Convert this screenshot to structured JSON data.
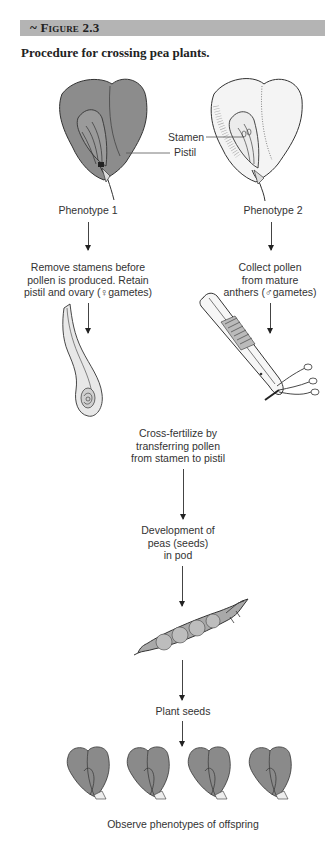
{
  "figure": {
    "number_label": "~ Figure 2.3",
    "caption": "Procedure for crossing pea plants."
  },
  "parents": {
    "left": {
      "label": "Phenotype 1",
      "shade": "#8c8c8c"
    },
    "right": {
      "label": "Phenotype 2",
      "shade": "#f2f2f2"
    },
    "callouts": {
      "stamen": "Stamen",
      "pistil": "Pistil"
    }
  },
  "steps": {
    "left_step": [
      "Remove stamens before",
      "pollen is produced.  Retain",
      "pistil and ovary (♀gametes)"
    ],
    "right_step": [
      "Collect pollen",
      "from mature",
      "anthers (♂gametes)"
    ],
    "cross": [
      "Cross-fertilize by",
      "transferring pollen",
      "from stamen to pistil"
    ],
    "develop": [
      "Development of",
      "peas (seeds)",
      "in pod"
    ],
    "plant": "Plant seeds",
    "observe": "Observe phenotypes of offspring"
  },
  "illustrations": {
    "ovary": "pistil-ovary-drawing",
    "tweezers": "forceps-with-anthers-drawing",
    "pod": "pea-pod-drawing",
    "offspring_count": 4,
    "offspring_shade": "#8a8a8a"
  }
}
